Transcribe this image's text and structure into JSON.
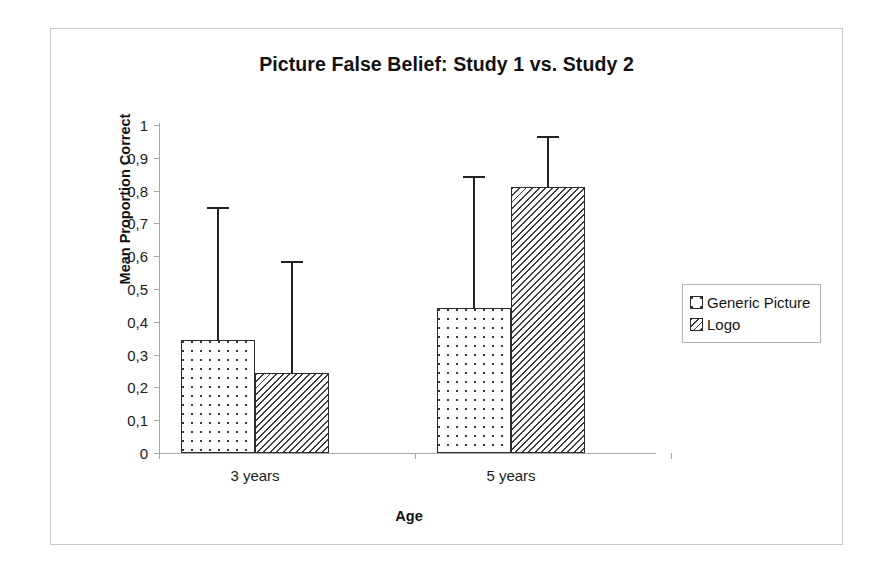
{
  "chart_data": {
    "type": "bar",
    "title": "Picture False Belief: Study 1 vs. Study 2",
    "xlabel": "Age",
    "ylabel": "Mean Proportion Correct",
    "categories": [
      "3 years",
      "5 years"
    ],
    "ylim": [
      0,
      1
    ],
    "ytick_labels": [
      "1",
      "0,9",
      "0,8",
      "0,7",
      "0,6",
      "0,5",
      "0,4",
      "0,3",
      "0,2",
      "0,1",
      "0"
    ],
    "ytick_values": [
      1,
      0.9,
      0.8,
      0.7,
      0.6,
      0.5,
      0.4,
      0.3,
      0.2,
      0.1,
      0
    ],
    "grid": false,
    "legend_position": "right",
    "series": [
      {
        "name": "Generic Picture",
        "fill": "dots",
        "values": [
          0.345,
          0.443
        ],
        "error_upper": [
          0.75,
          0.845
        ]
      },
      {
        "name": "Logo",
        "fill": "hatch",
        "values": [
          0.245,
          0.81
        ],
        "error_upper": [
          0.585,
          0.965
        ]
      }
    ],
    "colors": {
      "bar_outline": "#2b2b2b",
      "bar_fill": "#ffffff",
      "pattern": "#3a3a3a",
      "axis": "#a8a8a8",
      "error_bar": "#222222",
      "frame": "#c9c9c9",
      "text": "#1a1a1a"
    }
  },
  "legend": {
    "items": [
      {
        "label": "Generic Picture"
      },
      {
        "label": "Logo"
      }
    ]
  }
}
